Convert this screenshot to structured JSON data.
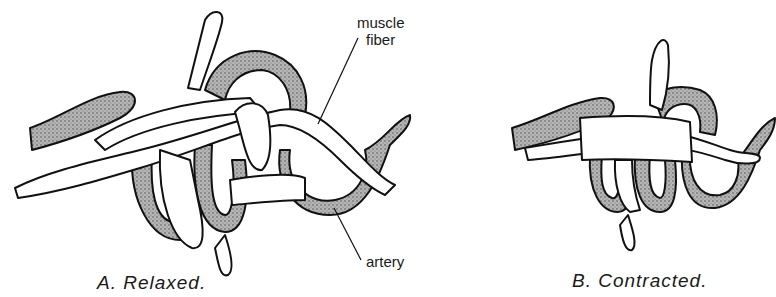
{
  "figure": {
    "panels": [
      {
        "id": "A",
        "caption": "A. Relaxed.",
        "labels": {
          "muscle_fiber_line1": "muscle",
          "muscle_fiber_line2": "fiber",
          "artery": "artery"
        }
      },
      {
        "id": "B",
        "caption": "B. Contracted."
      }
    ],
    "colors": {
      "artery_fill": "#9a9a9a",
      "fiber_fill": "#ffffff",
      "outline": "#111111"
    }
  }
}
